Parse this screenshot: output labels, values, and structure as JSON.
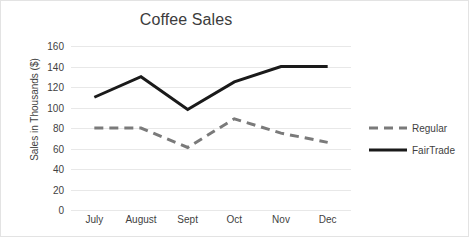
{
  "chart_data": {
    "type": "line",
    "title": "Coffee Sales",
    "xlabel": "",
    "ylabel": "Sales in Thousands ($)",
    "categories": [
      "July",
      "August",
      "Sept",
      "Oct",
      "Nov",
      "Dec"
    ],
    "series": [
      {
        "name": "Regular",
        "values": [
          80,
          80,
          61,
          89,
          75,
          66
        ],
        "color": "#7a7a7a",
        "style": "dashed",
        "width": 3
      },
      {
        "name": "FairTrade",
        "values": [
          110,
          130,
          98,
          125,
          140,
          140
        ],
        "color": "#1a1a1a",
        "style": "solid",
        "width": 3
      }
    ],
    "ylim": [
      0,
      160
    ],
    "ytick_values": [
      0,
      20,
      40,
      60,
      80,
      100,
      120,
      140,
      160
    ],
    "ytick_labels": [
      "0",
      "20",
      "40",
      "60",
      "80",
      "100",
      "120",
      "140",
      "160"
    ],
    "grid": true,
    "grid_color": "#e8e8e8",
    "legend_position": "right",
    "background": "#ffffff",
    "border_color": "#e3e3e3"
  }
}
